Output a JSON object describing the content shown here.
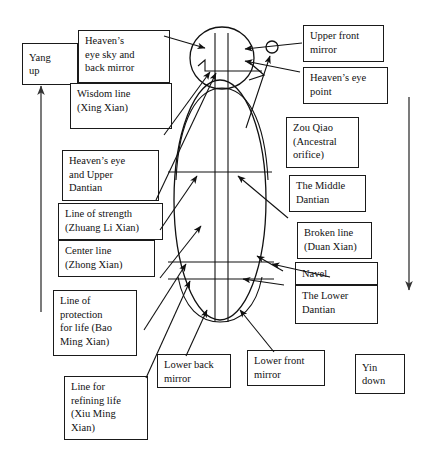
{
  "diagram": {
    "figure": {
      "head_label": "head-circle",
      "nose_label": "nose-triangle",
      "eye_point_label": "heaven-eye-point-dot",
      "torso_label": "torso-ellipse",
      "axis_label": "central-vertical-axis-lines"
    },
    "flow_indicators": {
      "yang": {
        "label": "Yang\nup",
        "direction": "up"
      },
      "yin": {
        "label": "Yin\ndown",
        "direction": "down"
      }
    },
    "labels": [
      {
        "id": "heavens-eye-sky-and-back-mirror",
        "text": "Heaven’s\neye sky and\nback mirror"
      },
      {
        "id": "wisdom-line-xing-xian",
        "text": "Wisdom line\n(Xing Xian)"
      },
      {
        "id": "heavens-eye-and-upper-dantian",
        "text": "Heaven’s eye\nand Upper\nDantian"
      },
      {
        "id": "line-of-strength-zhuang-li-xian",
        "text": "Line of strength\n(Zhuang Li Xian)"
      },
      {
        "id": "center-line-zhong-xian",
        "text": "Center line\n(Zhong Xian)"
      },
      {
        "id": "line-of-protection-for-life-bao-ming-xian",
        "text": "Line of\nprotection\nfor life (Bao\nMing Xian)"
      },
      {
        "id": "line-for-refining-life-xiu-ming-xian",
        "text": "Line for\nrefining life\n(Xiu Ming\nXian)"
      },
      {
        "id": "lower-back-mirror",
        "text": "Lower back\nmirror"
      },
      {
        "id": "lower-front-mirror",
        "text": "Lower front\nmirror"
      },
      {
        "id": "upper-front-mirror",
        "text": "Upper front\nmirror"
      },
      {
        "id": "heavens-eye-point",
        "text": "Heaven’s eye\npoint"
      },
      {
        "id": "zou-qiao-ancestral-orifice",
        "text": "Zou Qiao\n(Ancestral\norifice)"
      },
      {
        "id": "the-middle-dantian",
        "text": "The Middle\nDantian"
      },
      {
        "id": "broken-line-duan-xian",
        "text": "Broken line\n(Duan Xian)"
      },
      {
        "id": "navel",
        "text": "Navel"
      },
      {
        "id": "the-lower-dantian",
        "text": "The Lower\nDantian"
      }
    ],
    "colors": {
      "ink": "#111111",
      "paper": "#ffffff",
      "flow_arrow": "#333333"
    }
  }
}
